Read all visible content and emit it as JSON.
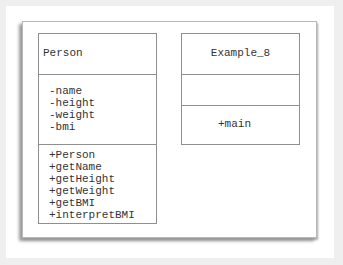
{
  "diagram": {
    "type": "uml-class-diagram",
    "classes": [
      {
        "name": "Person",
        "attributes": [
          "-name",
          "-height",
          "-weight",
          "-bmi"
        ],
        "operations": [
          "+Person",
          "+getName",
          "+getHeight",
          "+getWeight",
          "+getBMI",
          "+interpretBMI"
        ]
      },
      {
        "name": "Example_8",
        "attributes": [],
        "operations": [
          "+main"
        ]
      }
    ]
  }
}
